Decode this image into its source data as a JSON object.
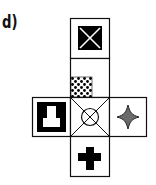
{
  "figure": {
    "label": "d)",
    "type": "cube-net",
    "faces": [
      {
        "position": "top",
        "symbol": "x-in-black-square"
      },
      {
        "position": "upper-middle",
        "symbol": "dotted-checker-square-bottom-left"
      },
      {
        "position": "left",
        "symbol": "inverted-t-on-black"
      },
      {
        "position": "center",
        "symbol": "circle-with-x-diagonals"
      },
      {
        "position": "right",
        "symbol": "gray-four-point-star"
      },
      {
        "position": "bottom",
        "symbol": "black-plus"
      }
    ],
    "colors": {
      "outline": "#111111",
      "star_fill": "#6b6b6b",
      "background": "#ffffff"
    }
  }
}
